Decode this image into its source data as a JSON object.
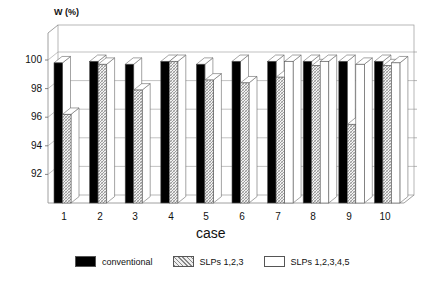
{
  "chart_data": {
    "type": "bar",
    "style": "3d-grouped",
    "title": "",
    "ylabel": "W (%)",
    "xlabel": "case",
    "ylim": [
      90,
      100
    ],
    "yticks": [
      92,
      94,
      96,
      98,
      100
    ],
    "grid": true,
    "legend_position": "bottom",
    "categories": [
      "1",
      "2",
      "3",
      "4",
      "5",
      "6",
      "7",
      "8",
      "9",
      "10"
    ],
    "series": [
      {
        "name": "conventional",
        "fill": "black",
        "values": [
          99.8,
          99.9,
          99.7,
          99.9,
          99.7,
          99.9,
          99.9,
          99.9,
          99.9,
          99.9
        ]
      },
      {
        "name": "SLPs 1,2,3",
        "fill": "hatched",
        "values": [
          96.2,
          99.7,
          97.9,
          99.9,
          98.6,
          98.4,
          98.8,
          99.6,
          95.5,
          99.6
        ]
      },
      {
        "name": "SLPs 1,2,3,4,5",
        "fill": "white",
        "values": [
          null,
          null,
          null,
          null,
          null,
          null,
          99.9,
          99.9,
          99.7,
          99.8
        ]
      }
    ]
  },
  "axis": {
    "y_title": "W (%)",
    "x_title": "case",
    "y_ticks": [
      "100",
      "98",
      "96",
      "94",
      "92"
    ],
    "x_ticks": [
      "1",
      "2",
      "3",
      "4",
      "5",
      "6",
      "7",
      "8",
      "9",
      "10"
    ]
  },
  "legend": {
    "items": [
      {
        "label": "conventional"
      },
      {
        "label": "SLPs 1,2,3"
      },
      {
        "label": "SLPs 1,2,3,4,5"
      }
    ]
  }
}
